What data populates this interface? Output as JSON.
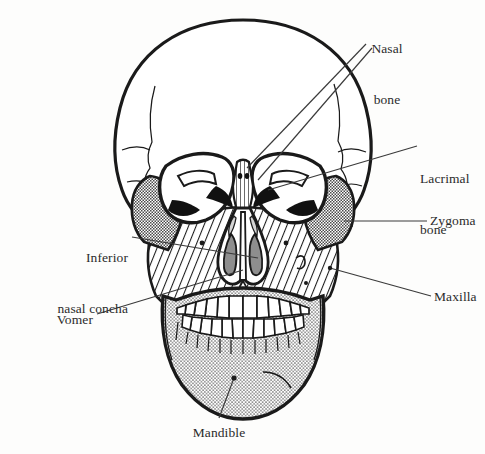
{
  "figure": {
    "background_color": "#fdfdfc",
    "ink_color": "#1a1a1a",
    "leader_line_color": "#3a3a3a"
  },
  "labels": [
    {
      "id": "nasal-bone",
      "lines": [
        "Nasal",
        "bone"
      ],
      "text": "Nasal bone",
      "align": "center",
      "x": 357,
      "y": 6,
      "width": 60
    },
    {
      "id": "lacrimal-bone",
      "lines": [
        "Lacrimal",
        "bone"
      ],
      "text": "Lacrimal bone",
      "align": "left",
      "x": 420,
      "y": 136,
      "width": 65
    },
    {
      "id": "zygoma",
      "lines": [
        "Zygoma"
      ],
      "text": "Zygoma",
      "align": "left",
      "x": 430,
      "y": 212,
      "width": 55
    },
    {
      "id": "maxilla",
      "lines": [
        "Maxilla"
      ],
      "text": "Maxilla",
      "align": "left",
      "x": 434,
      "y": 288,
      "width": 51
    },
    {
      "id": "inferior-nasal-concha",
      "lines": [
        "Inferior",
        "nasal concha"
      ],
      "text": "Inferior nasal concha",
      "align": "right",
      "x": 18,
      "y": 215,
      "width": 110
    },
    {
      "id": "vomer",
      "lines": [
        "Vomer"
      ],
      "text": "Vomer",
      "align": "right",
      "x": 45,
      "y": 311,
      "width": 48
    },
    {
      "id": "mandible",
      "lines": [
        "Mandible"
      ],
      "text": "Mandible",
      "align": "center",
      "x": 185,
      "y": 424,
      "width": 68
    }
  ],
  "structures": [
    {
      "id": "cranium",
      "name": "Cranium / frontal bone",
      "fill": "plain-white"
    },
    {
      "id": "nasal-bone",
      "name": "Nasal bone",
      "fill": "vertical-lines"
    },
    {
      "id": "lacrimal-bone",
      "name": "Lacrimal bone",
      "fill": "solid-black"
    },
    {
      "id": "zygoma",
      "name": "Zygomatic bone",
      "fill": "gray-checker"
    },
    {
      "id": "maxilla",
      "name": "Maxilla",
      "fill": "diagonal-hatch"
    },
    {
      "id": "mandible",
      "name": "Mandible",
      "fill": "stipple-dots"
    },
    {
      "id": "vomer",
      "name": "Vomer",
      "fill": "plain-white"
    },
    {
      "id": "inferior-nasal-concha",
      "name": "Inferior nasal concha",
      "fill": "gray-solid"
    },
    {
      "id": "orbits",
      "name": "Orbital cavities",
      "fill": "plain-white"
    },
    {
      "id": "teeth-upper",
      "name": "Upper dental arch",
      "fill": "plain-white"
    },
    {
      "id": "teeth-lower",
      "name": "Lower dental arch",
      "fill": "plain-white"
    }
  ]
}
